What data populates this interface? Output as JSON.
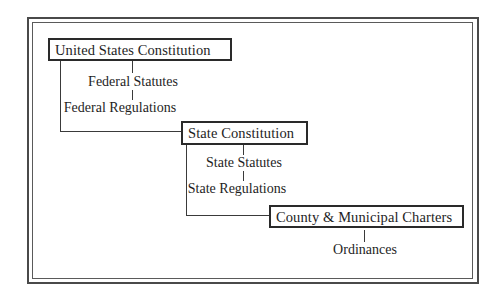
{
  "diagram": {
    "title": "",
    "levels": [
      {
        "heading": "United States Constitution",
        "children": [
          "Federal Statutes",
          "Federal Regulations"
        ]
      },
      {
        "heading": "State Constitution",
        "children": [
          "State Statutes",
          "State Regulations"
        ]
      },
      {
        "heading": "County & Municipal Charters",
        "children": [
          "Ordinances"
        ]
      }
    ]
  }
}
